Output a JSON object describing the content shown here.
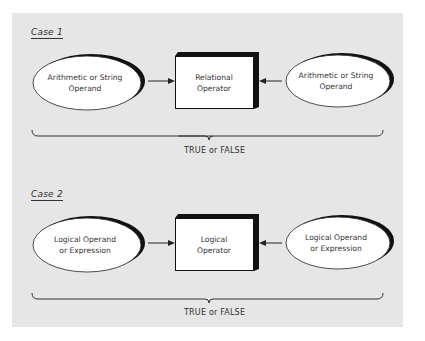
{
  "colors": {
    "panel_bg": "#e6e6e6",
    "shape_fill": "#ffffff",
    "stroke": "#222222",
    "text": "#333333"
  },
  "cases": [
    {
      "label": "Case 1",
      "left_operand": {
        "line1": "Arithmetic or String",
        "line2": "Operand"
      },
      "operator": {
        "line1": "Relational",
        "line2": "Operator"
      },
      "right_operand": {
        "line1": "Arithmetic or String",
        "line2": "Operand"
      },
      "result": "TRUE or FALSE"
    },
    {
      "label": "Case 2",
      "left_operand": {
        "line1": "Logical Operand",
        "line2": "or Expression"
      },
      "operator": {
        "line1": "Logical",
        "line2": "Operator"
      },
      "right_operand": {
        "line1": "Logical Operand",
        "line2": "or Expression"
      },
      "result": "TRUE or FALSE"
    }
  ]
}
